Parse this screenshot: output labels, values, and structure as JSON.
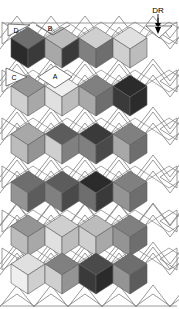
{
  "figure": {
    "background": "#ffffff",
    "width": 179,
    "height": 309,
    "line_color": "#808080",
    "outline_color": "#6b6b6b"
  },
  "annotations": {
    "dr": {
      "text": "DR",
      "x": 158,
      "y": 10
    },
    "region_d": {
      "text": "D",
      "x": 16,
      "y": 29
    },
    "region_b": {
      "text": "B",
      "x": 50,
      "y": 27
    },
    "region_c": {
      "text": "C",
      "x": 16,
      "y": 77
    },
    "region_a": {
      "text": "A",
      "x": 55,
      "y": 76
    }
  },
  "grid": {
    "origin_x": 16,
    "origin_y": 20,
    "cell_w": 34,
    "cell_h": 22,
    "cube_w": 34,
    "cube_h": 40,
    "rows": 6,
    "cols": 4
  },
  "palette": {
    "f1": "#2b2b2b",
    "f2": "#3a3a3a",
    "f3": "#4a4a4a",
    "f4": "#5c5c5c",
    "f5": "#6e6e6e",
    "f6": "#808080",
    "f7": "#949494",
    "f8": "#a8a8a8",
    "f9": "#bcbcbc",
    "f10": "#cfcfcf",
    "f11": "#e0e0e0",
    "f12": "#efefef",
    "white": "#ffffff",
    "line": "#8a8a8a"
  },
  "chart_data": {
    "type": "heatmap",
    "xlabel": "",
    "ylabel": "",
    "grid": true,
    "legend": "none",
    "note": "Each row contains 4 isometric cubes; each cube has three visible faces (top, left, right) with distinct gray levels.",
    "rows": [
      {
        "row": 1,
        "y": 32,
        "cubes": [
          {
            "col": 1,
            "x": 22,
            "top": "#6e6e6e",
            "left": "#2b2b2b",
            "right": "#3a3a3a"
          },
          {
            "col": 2,
            "x": 56,
            "top": "#bcbcbc",
            "left": "#a8a8a8",
            "right": "#3a3a3a"
          },
          {
            "col": 3,
            "x": 90,
            "top": "#cfcfcf",
            "left": "#808080",
            "right": "#6e6e6e"
          },
          {
            "col": 4,
            "x": 124,
            "top": "#e0e0e0",
            "left": "#cfcfcf",
            "right": "#bcbcbc"
          }
        ]
      },
      {
        "row": 2,
        "y": 80,
        "cubes": [
          {
            "col": 1,
            "x": 22,
            "top": "#949494",
            "left": "#cfcfcf",
            "right": "#a8a8a8"
          },
          {
            "col": 2,
            "x": 56,
            "top": "#efefef",
            "left": "#e0e0e0",
            "right": "#bcbcbc"
          },
          {
            "col": 3,
            "x": 90,
            "top": "#808080",
            "left": "#a8a8a8",
            "right": "#6e6e6e"
          },
          {
            "col": 4,
            "x": 124,
            "top": "#2b2b2b",
            "left": "#3a3a3a",
            "right": "#2b2b2b"
          }
        ]
      },
      {
        "row": 3,
        "y": 128,
        "cubes": [
          {
            "col": 1,
            "x": 22,
            "top": "#a8a8a8",
            "left": "#bcbcbc",
            "right": "#949494"
          },
          {
            "col": 2,
            "x": 56,
            "top": "#5c5c5c",
            "left": "#cfcfcf",
            "right": "#808080"
          },
          {
            "col": 3,
            "x": 90,
            "top": "#3a3a3a",
            "left": "#808080",
            "right": "#4a4a4a"
          },
          {
            "col": 4,
            "x": 124,
            "top": "#808080",
            "left": "#a8a8a8",
            "right": "#6e6e6e"
          }
        ]
      },
      {
        "row": 4,
        "y": 176,
        "cubes": [
          {
            "col": 1,
            "x": 22,
            "top": "#6e6e6e",
            "left": "#949494",
            "right": "#5c5c5c"
          },
          {
            "col": 2,
            "x": 56,
            "top": "#5c5c5c",
            "left": "#808080",
            "right": "#4a4a4a"
          },
          {
            "col": 3,
            "x": 90,
            "top": "#2b2b2b",
            "left": "#6e6e6e",
            "right": "#3a3a3a"
          },
          {
            "col": 4,
            "x": 124,
            "top": "#808080",
            "left": "#949494",
            "right": "#6e6e6e"
          }
        ]
      },
      {
        "row": 5,
        "y": 220,
        "cubes": [
          {
            "col": 1,
            "x": 22,
            "top": "#949494",
            "left": "#bcbcbc",
            "right": "#a8a8a8"
          },
          {
            "col": 2,
            "x": 56,
            "top": "#cfcfcf",
            "left": "#e0e0e0",
            "right": "#bcbcbc"
          },
          {
            "col": 3,
            "x": 90,
            "top": "#bcbcbc",
            "left": "#cfcfcf",
            "right": "#a8a8a8"
          },
          {
            "col": 4,
            "x": 124,
            "top": "#808080",
            "left": "#949494",
            "right": "#6e6e6e"
          }
        ]
      },
      {
        "row": 6,
        "y": 258,
        "cubes": [
          {
            "col": 1,
            "x": 22,
            "top": "#e0e0e0",
            "left": "#efefef",
            "right": "#cfcfcf"
          },
          {
            "col": 2,
            "x": 56,
            "top": "#808080",
            "left": "#cfcfcf",
            "right": "#949494"
          },
          {
            "col": 3,
            "x": 90,
            "top": "#4a4a4a",
            "left": "#3a3a3a",
            "right": "#2b2b2b"
          },
          {
            "col": 4,
            "x": 124,
            "top": "#6e6e6e",
            "left": "#949494",
            "right": "#5c5c5c"
          }
        ]
      }
    ]
  }
}
